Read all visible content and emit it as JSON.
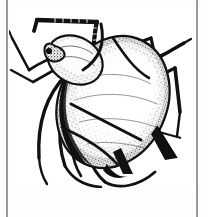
{
  "figure": {
    "domain_label": "Natural-Image",
    "view": "dorsal",
    "style": "black-and-white stipple line engraving",
    "medium": "scanned book plate",
    "caption": "",
    "frame": {
      "visible": true,
      "stroke_color": "#2b2b2b",
      "fill_color": "#ffffff",
      "left": 9,
      "top": 8,
      "width": 186,
      "height": 180
    },
    "canvas": {
      "width": 208,
      "height": 217,
      "background_color": "#fdfdfd"
    },
    "scan_edges": [
      {
        "name": "left-scan-edge",
        "x": 6,
        "color": "#9a9a9c"
      },
      {
        "name": "right-scan-edge",
        "x": 196,
        "color": "#9a9a9c"
      }
    ],
    "ink_color": "#111111",
    "stipple_color": "#3a3a3a",
    "highlight_color": "#ffffff",
    "anatomy": [
      {
        "id": "abdomen",
        "label": "abdomen"
      },
      {
        "id": "thorax",
        "label": "thorax"
      },
      {
        "id": "head",
        "label": "head"
      },
      {
        "id": "antenna-left",
        "label": "left antenna"
      },
      {
        "id": "antenna-right",
        "label": "right antenna"
      },
      {
        "id": "cornicle-left",
        "label": "left cornicle"
      },
      {
        "id": "cornicle-right",
        "label": "right cornicle"
      },
      {
        "id": "cauda",
        "label": "cauda"
      },
      {
        "id": "leg-fore-left",
        "label": "fore left leg"
      },
      {
        "id": "leg-fore-right",
        "label": "fore right leg"
      },
      {
        "id": "leg-mid-left",
        "label": "mid left leg"
      },
      {
        "id": "leg-mid-right",
        "label": "mid right leg"
      },
      {
        "id": "leg-hind-left",
        "label": "hind left leg"
      },
      {
        "id": "leg-hind-right",
        "label": "hind right leg"
      }
    ]
  }
}
